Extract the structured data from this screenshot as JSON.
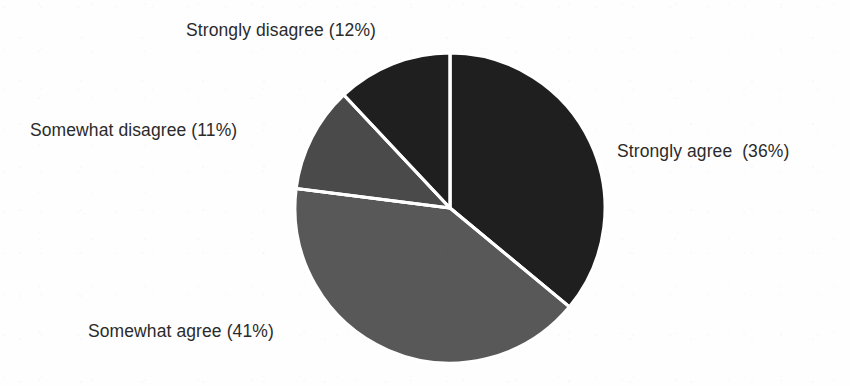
{
  "page": {
    "background": "#fefefe",
    "width": 850,
    "height": 386
  },
  "chart_data": {
    "type": "pie",
    "title": "",
    "subtitle": "",
    "xlabel": "",
    "ylabel": "",
    "legend_position": "none",
    "grid": false,
    "label_format": "{name} ({value}%)",
    "start_angle_deg": 0,
    "direction": "clockwise",
    "center": {
      "x": 450,
      "y": 208
    },
    "radius": 155,
    "separator_color": "#ffffff",
    "separator_width": 3,
    "categories": [
      "Strongly agree",
      "Somewhat agree",
      "Somewhat disagree",
      "Strongly disagree"
    ],
    "values": [
      36,
      41,
      11,
      12
    ],
    "units": "percent",
    "total": 100,
    "slices": [
      {
        "name": "Strongly agree",
        "value": 36,
        "label": "Strongly agree  (36%)",
        "color": "#1f1f1f",
        "start_deg": 0.0,
        "end_deg": 129.6
      },
      {
        "name": "Somewhat agree",
        "value": 41,
        "label": "Somewhat agree (41%)",
        "color": "#585858",
        "start_deg": 129.6,
        "end_deg": 277.2
      },
      {
        "name": "Somewhat disagree",
        "value": 11,
        "label": "Somewhat disagree (11%)",
        "color": "#4a4a4a",
        "start_deg": 277.2,
        "end_deg": 316.8
      },
      {
        "name": "Strongly disagree",
        "value": 12,
        "label": "Strongly disagree (12%)",
        "color": "#1f1f1f",
        "start_deg": 316.8,
        "end_deg": 360.0
      }
    ]
  },
  "labels": {
    "strongly_disagree": "Strongly disagree (12%)",
    "somewhat_disagree": "Somewhat disagree (11%)",
    "strongly_agree": "Strongly agree  (36%)",
    "somewhat_agree": "Somewhat agree (41%)"
  },
  "colors": {
    "strongly_agree": "#1f1f1f",
    "somewhat_agree": "#585858",
    "somewhat_disagree": "#4a4a4a",
    "strongly_disagree": "#1f1f1f",
    "label_text": "#2b2b2b",
    "separator": "#ffffff",
    "background": "#fefefe"
  }
}
